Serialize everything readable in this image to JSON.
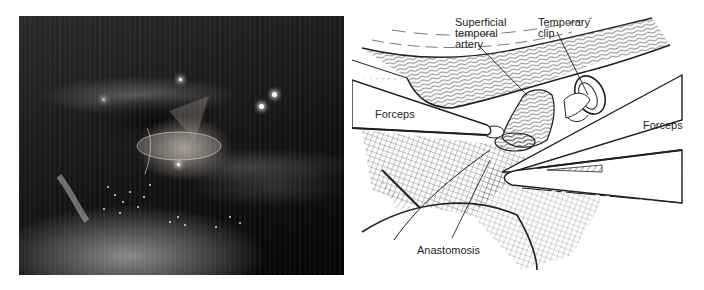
{
  "figure": {
    "left_panel": {
      "type": "photograph",
      "description": "Intraoperative microscope view of anastomosis"
    },
    "right_panel": {
      "type": "illustration",
      "labels": {
        "superficial_temporal_artery": "Superficial\ntemporal\nartery",
        "temporary_clip": "Temporary\nclip",
        "forceps_left": "Forceps",
        "forceps_right": "Forceps",
        "anastomosis": "Anastomosis"
      }
    },
    "colors": {
      "background": "#ffffff",
      "ink": "#231f20"
    }
  }
}
